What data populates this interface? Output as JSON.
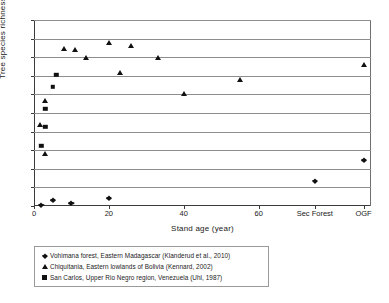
{
  "chart_data": {
    "type": "scatter",
    "title": "",
    "xlabel": "Stand age (year)",
    "ylabel": "Tree species richness",
    "ylim": [
      0,
      50
    ],
    "ytick_values": [
      0,
      5,
      10,
      15,
      20,
      25,
      30,
      35,
      40,
      45,
      50
    ],
    "ytick_labels": [
      "0",
      "5",
      "10",
      "15",
      "20",
      "25",
      "30",
      "35",
      "40",
      "45",
      "50"
    ],
    "xtick_labels": [
      "0",
      "20",
      "40",
      "60",
      "Sec Forest",
      "OGF"
    ],
    "xtick_positions": [
      0,
      20,
      40,
      60,
      75,
      88
    ],
    "xlim": [
      0,
      90
    ],
    "grid": true,
    "legend_position": "below-axes",
    "series": [
      {
        "name": "Vohimana forest, Eastern Madagascar (Klanderud et al., 2010)",
        "marker": "diamond",
        "color": "#111111",
        "points": [
          {
            "x": 2,
            "y": 0.4
          },
          {
            "x": 5,
            "y": 1.5
          },
          {
            "x": 10,
            "y": 0.8
          },
          {
            "x": 20,
            "y": 2.1
          },
          {
            "x": 75,
            "y": 6.8
          },
          {
            "x": 88,
            "y": 12.3
          }
        ]
      },
      {
        "name": "Chiquitania, Eastern lowlands of Bolivia (Kennard, 2002)",
        "marker": "triangle",
        "color": "#111111",
        "points": [
          {
            "x": 1.5,
            "y": 21.9
          },
          {
            "x": 3,
            "y": 14.0
          },
          {
            "x": 3,
            "y": 28.2
          },
          {
            "x": 8,
            "y": 42.2
          },
          {
            "x": 11,
            "y": 42.0
          },
          {
            "x": 14,
            "y": 39.9
          },
          {
            "x": 20,
            "y": 43.8
          },
          {
            "x": 23,
            "y": 35.7
          },
          {
            "x": 26,
            "y": 43.0
          },
          {
            "x": 33,
            "y": 39.9
          },
          {
            "x": 40,
            "y": 30.0
          },
          {
            "x": 55,
            "y": 34.0
          },
          {
            "x": 88,
            "y": 38.0
          }
        ]
      },
      {
        "name": "San Carlos, Upper Rio Negro region, Venezuela (Uhl, 1987)",
        "marker": "square",
        "color": "#111111",
        "points": [
          {
            "x": 2,
            "y": 16.2
          },
          {
            "x": 3,
            "y": 21.3
          },
          {
            "x": 3,
            "y": 26.2
          },
          {
            "x": 5,
            "y": 32.1
          },
          {
            "x": 6,
            "y": 35.2
          }
        ]
      }
    ]
  },
  "axes": {
    "y_title": "Tree species richness",
    "x_title": "Stand age (year)"
  },
  "legend": {
    "entries": [
      {
        "marker": "diamond",
        "label": "Vohimana forest, Eastern Madagascar (Klanderud et al., 2010)"
      },
      {
        "marker": "triangle",
        "label": "Chiquitania, Eastern lowlands of Bolivia (Kennard, 2002)"
      },
      {
        "marker": "square",
        "label": "San Carlos, Upper Rio Negro region, Venezuela (Uhl, 1987)"
      }
    ]
  }
}
